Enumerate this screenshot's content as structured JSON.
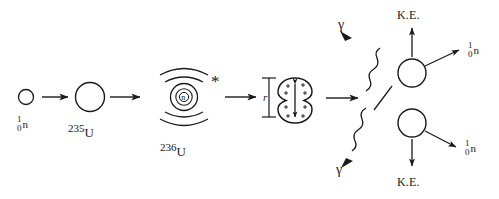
{
  "diagram": {
    "stroke_color": "#1a1a1a",
    "background": "#ffffff",
    "stages": [
      {
        "id": "incident-neutron",
        "label_mass": "1",
        "label_charge": "0",
        "label_symbol": "n"
      },
      {
        "id": "u235-nucleus",
        "mass_number": "235",
        "symbol": "U"
      },
      {
        "id": "u236-compound-nucleus",
        "mass_number": "236",
        "symbol": "U",
        "excited_marker": "*",
        "inner_particle": "n"
      },
      {
        "id": "deformed-nucleus",
        "dimension_label": "r",
        "charge_marker": "+"
      }
    ],
    "products": {
      "top_fragment": {
        "kinetic_energy_label": "K.E.",
        "gamma_label": "γ",
        "neutron_mass": "1",
        "neutron_charge": "0",
        "neutron_symbol": "n"
      },
      "bottom_fragment": {
        "kinetic_energy_label": "K.E.",
        "gamma_label": "γ",
        "neutron_mass": "1",
        "neutron_charge": "0",
        "neutron_symbol": "n"
      }
    }
  }
}
